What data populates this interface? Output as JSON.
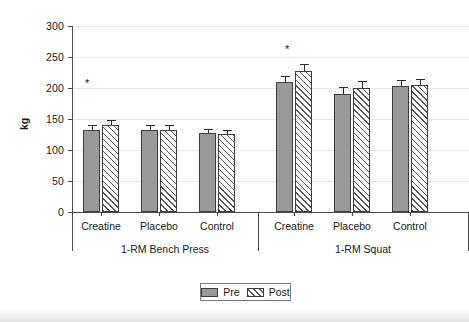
{
  "figure": {
    "background_color": "#ffffff",
    "axis_color": "#4a4a4a",
    "grid_color": "#e8e8e8"
  },
  "chart_data": {
    "type": "bar",
    "title": "",
    "xlabel": "",
    "ylabel": "kg",
    "ylim": [
      0,
      300
    ],
    "yticks": [
      0,
      50,
      100,
      150,
      200,
      250,
      300
    ],
    "grid": true,
    "grid_axis": "y",
    "legend_position": "bottom-center",
    "groups": [
      "1-RM Bench Press",
      "1-RM Squat"
    ],
    "categories": [
      "Creatine",
      "Placebo",
      "Control",
      "Creatine",
      "Placebo",
      "Control"
    ],
    "series": [
      {
        "name": "Pre",
        "fill": "#9a9a9a",
        "pattern": "dotted-gray",
        "values": [
          132,
          132,
          128,
          210,
          190,
          203
        ],
        "errors": [
          9,
          9,
          6,
          10,
          11,
          10
        ]
      },
      {
        "name": "Post",
        "fill": "#ffffff",
        "pattern": "diagonal-hatch",
        "values": [
          140,
          132,
          126,
          228,
          200,
          205
        ],
        "errors": [
          9,
          9,
          6,
          10,
          11,
          10
        ]
      }
    ],
    "annotations": [
      {
        "label": "*",
        "group": "1-RM Bench Press",
        "category": "Creatine",
        "y": 205
      },
      {
        "label": "*",
        "group": "1-RM Squat",
        "category": "Creatine",
        "y": 260
      }
    ]
  },
  "axes": {
    "y_title": "kg",
    "y_tick_labels": [
      "300",
      "250",
      "200",
      "150",
      "100",
      "50",
      "0"
    ],
    "x_tick_labels": [
      "Creatine",
      "Placebo",
      "Control",
      "Creatine",
      "Placebo",
      "Control"
    ],
    "group_labels": [
      "1-RM Bench Press",
      "1-RM Squat"
    ]
  },
  "legend": {
    "entries": [
      {
        "label": "Pre",
        "swatch": "pre-swatch"
      },
      {
        "label": "Post",
        "swatch": "post-swatch"
      }
    ]
  }
}
